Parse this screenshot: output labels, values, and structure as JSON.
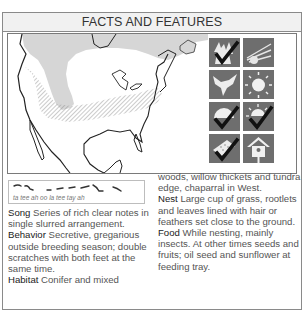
{
  "header": {
    "title": "FACTS AND FEATURES"
  },
  "map": {
    "region": "North America",
    "legend": {
      "breeding_range": "gray fill",
      "year_round_range": "white",
      "winter_range": "hatched"
    }
  },
  "icons": [
    {
      "name": "forest-habitat-icon",
      "checked": true
    },
    {
      "name": "sunrise-rays-icon",
      "checked": false
    },
    {
      "name": "bird-flying-icon",
      "checked": false
    },
    {
      "name": "sun-icon",
      "checked": false
    },
    {
      "name": "half-sun-icon",
      "checked": true
    },
    {
      "name": "sunset-icon",
      "checked": true
    },
    {
      "name": "feeding-tray-icon",
      "checked": true
    },
    {
      "name": "birdhouse-icon",
      "checked": false
    }
  ],
  "song_sketch": {
    "phonetic": "ta tee ah oo la tee tay ah"
  },
  "sections": {
    "song": {
      "label": "Song",
      "text": "Series of rich clear notes in single slurred arrangement."
    },
    "behavior": {
      "label": "Behavior",
      "text": "Secretive, gregarious outside breeding season; double scratches with both feet at the same time."
    },
    "habitat": {
      "label": "Habitat",
      "text": "Conifer and mixed",
      "text_cont": "woods, willow thickets and tundra edge, chaparral in West."
    },
    "nest": {
      "label": "Nest",
      "text": "Large cup of grass, rootlets and leaves lined with hair or feathers set close to the ground."
    },
    "food": {
      "label": "Food",
      "text": "While nesting, mainly insects. At other times seeds and fruits; oil seed and sunflower at feeding tray."
    }
  },
  "colors": {
    "border": "#8a8a8a",
    "header_bg": "#f1f1f1",
    "map_gray": "#d6d6d6",
    "icon_bg": "#6e6e6e",
    "check": "#111111"
  }
}
